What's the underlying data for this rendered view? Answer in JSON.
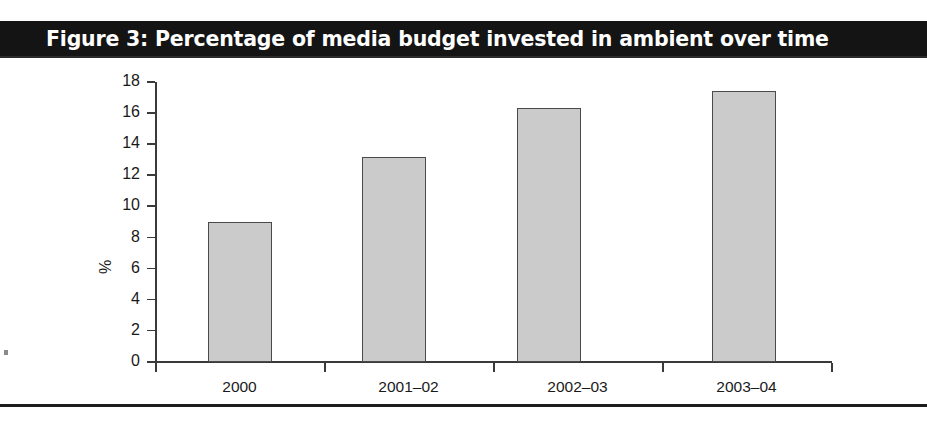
{
  "figure": {
    "title": "Figure 3: Percentage of media budget invested in ambient over time",
    "title_bar_color": "#141414",
    "title_text_color": "#ffffff"
  },
  "axes": {
    "y_axis_title": "%",
    "y_tick_labels": [
      "18",
      "16",
      "14",
      "12",
      "10",
      "8",
      "6",
      "4",
      "2",
      "0"
    ],
    "x_tick_labels": [
      "2000",
      "2001–02",
      "2002–03",
      "2003–04"
    ]
  },
  "colors": {
    "bar_fill": "#cbcbcb",
    "bar_border": "#4a4a4a",
    "axis": "#3a3a3a",
    "text": "#1a1a1a",
    "footer_rule": "#1c1c1c"
  },
  "chart_data": {
    "type": "bar",
    "title": "Figure 3: Percentage of media budget invested in ambient over time",
    "xlabel": "",
    "ylabel": "%",
    "categories": [
      "2000",
      "2001–02",
      "2002–03",
      "2003–04"
    ],
    "values": [
      9.0,
      13.2,
      16.3,
      17.4
    ],
    "ylim": [
      0,
      18
    ],
    "ytick_step": 2,
    "yticks": [
      0,
      2,
      4,
      6,
      8,
      10,
      12,
      14,
      16,
      18
    ],
    "grid": false,
    "legend": false,
    "series": [
      {
        "name": "Percentage of media budget invested in ambient",
        "values": [
          9.0,
          13.2,
          16.3,
          17.4
        ]
      }
    ]
  }
}
